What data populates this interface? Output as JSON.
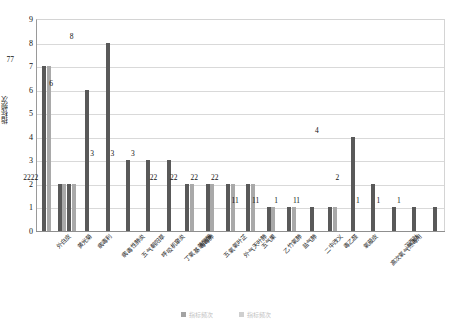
{
  "chart_data": {
    "type": "bar",
    "title": "",
    "xlabel": "",
    "ylabel": "指标频次",
    "ylim": [
      0,
      9
    ],
    "yticks": [
      0,
      1,
      2,
      3,
      4,
      5,
      6,
      7,
      8,
      9
    ],
    "grid": true,
    "legend_position": "bottom",
    "categories": [
      "外白皮",
      "黄光菊",
      "病毒利",
      "病毒性肺炎",
      "五气朝阳草",
      "呼吸机窜炎",
      "丁氧基黄酮醇",
      "毒毒肺",
      "五氧氧叶芷",
      "外气天叶肺",
      "五气果",
      "乙竹氧肺",
      "盐气肺",
      "二中改义",
      "毒乙醛",
      "氧蔽皮",
      "高次氧气热毒用",
      "沉西肽"
    ],
    "groups": [
      {
        "label": "外白皮",
        "values": [
          7,
          7
        ],
        "value_label": "77"
      },
      {
        "label": "黄光菊",
        "values": [
          2,
          2,
          2,
          2
        ],
        "value_label": "2222"
      },
      {
        "label": "病毒利",
        "values": [
          6
        ],
        "value_label": "6"
      },
      {
        "label": "病毒性肺炎",
        "values": [
          8
        ],
        "value_label": "8"
      },
      {
        "label": "五气朝阳草",
        "values": [
          3
        ],
        "value_label": "3"
      },
      {
        "label": "呼吸机窜炎",
        "values": [
          3
        ],
        "value_label": "3"
      },
      {
        "label": "丁氧基黄酮醇",
        "values": [
          3
        ],
        "value_label": "3"
      },
      {
        "label": "毒毒肺",
        "values": [
          2,
          2
        ],
        "value_label": "22"
      },
      {
        "label": "五氧氧叶芷",
        "values": [
          2,
          2
        ],
        "value_label": "22"
      },
      {
        "label": "外气天叶肺",
        "values": [
          2,
          2
        ],
        "value_label": "22"
      },
      {
        "label": "五气果",
        "values": [
          2,
          2
        ],
        "value_label": "22"
      },
      {
        "label": "乙竹氧肺",
        "values": [
          1,
          1
        ],
        "value_label": "11"
      },
      {
        "label": "盐气肺",
        "values": [
          1,
          1
        ],
        "value_label": "11"
      },
      {
        "label": "二中改义",
        "values": [
          1
        ],
        "value_label": "1"
      },
      {
        "label": "毒乙醛",
        "values": [
          1,
          1
        ],
        "value_label": "11"
      },
      {
        "label": "氧蔽皮",
        "values": [
          4
        ],
        "value_label": "4"
      },
      {
        "label": "高次氧气热毒用",
        "values": [
          2
        ],
        "value_label": "2"
      },
      {
        "label": "沉西肽",
        "values": [
          1
        ],
        "value_label": "1"
      },
      {
        "label": "x18",
        "values": [
          1
        ],
        "value_label": "1"
      },
      {
        "label": "x19",
        "values": [
          1
        ],
        "value_label": "1"
      }
    ],
    "colors": {
      "dark": "#595959",
      "light": "#a9a9a9"
    }
  },
  "axis": {
    "y_title": "指标频次",
    "y_ticks": [
      "0",
      "1",
      "2",
      "3",
      "4",
      "5",
      "6",
      "7",
      "8",
      "9"
    ]
  },
  "x_labels": [
    "外白皮",
    "黄光菊",
    "病毒利",
    "病毒性肺炎",
    "五气朝阳草",
    "呼吸机窜炎",
    "丁氧基黄酮醇",
    "毒毒肺",
    "五氧氧叶芷",
    "外气天叶肺",
    "五气果",
    "乙竹氧肺",
    "盐气肺",
    "二中改义",
    "毒乙醛",
    "氧蔽皮",
    "高次氧气热毒用",
    "沉西肽"
  ],
  "legend": {
    "items": [
      {
        "label": "指标频次",
        "color": "#595959"
      },
      {
        "label": "指标频次",
        "color": "#a9a9a9"
      }
    ]
  }
}
